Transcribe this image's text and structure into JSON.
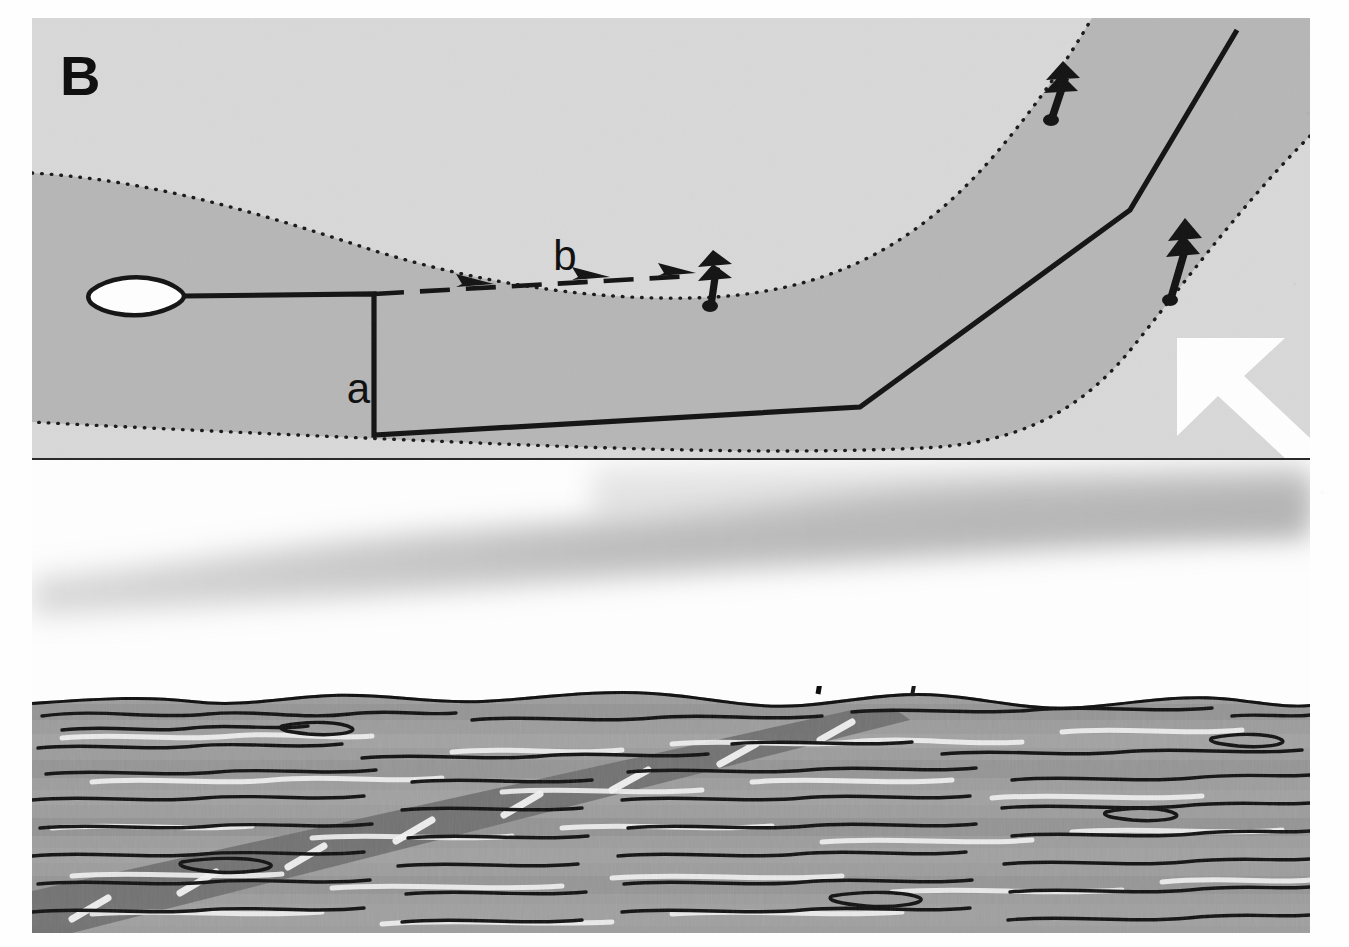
{
  "figure": {
    "panel_label": "B"
  },
  "map": {
    "labels": [
      {
        "id": "label-a",
        "text": "a",
        "x": 352,
        "y": 381,
        "size": 38
      },
      {
        "id": "label-b",
        "text": "b",
        "x": 533,
        "y": 258,
        "size": 38
      }
    ],
    "legend": {
      "north_arrow": "north-arrow",
      "vessel": "vessel-marker",
      "track_solid": "vessel-track-solid",
      "track_dashed": "vessel-track-dashed",
      "channel_edge": "dotted-channel-edge"
    },
    "markers": [
      {
        "id": "marker-1",
        "name": "channel-marker-upper-right"
      },
      {
        "id": "marker-2",
        "name": "channel-marker-right"
      },
      {
        "id": "marker-3",
        "name": "channel-marker-b-end"
      }
    ]
  },
  "colors": {
    "background_light_gray": "#d8d8d8",
    "channel_mid_gray": "#b6b6b6",
    "ink_black": "#121212",
    "page_white": "#ffffff",
    "sky_white": "#fcfcfc",
    "water_gray": "#9a9a9a",
    "water_dark_band": "#7c7c7c",
    "water_highlight": "#f2f2f2"
  },
  "water": {
    "poles": [
      "mooring-pole-tall",
      "mooring-pole-short"
    ],
    "net_band": "submerged-net-band"
  }
}
